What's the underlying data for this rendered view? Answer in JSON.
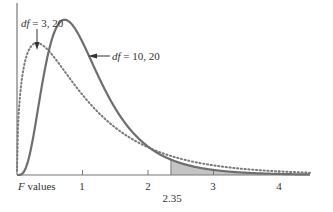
{
  "chart_data": {
    "type": "line",
    "title": "",
    "xlabel": "F values",
    "ylabel": "",
    "xlim": [
      0,
      4.45
    ],
    "x_ticks": [
      1,
      2,
      3,
      4
    ],
    "x_tick_labels": [
      "1",
      "2",
      "3",
      "4"
    ],
    "grid": false,
    "series": [
      {
        "name": "df = 3, 20",
        "df1": 3,
        "df2": 20,
        "style": "dotted",
        "color": "#7a7a7a",
        "peak_x": 0.3,
        "peak_y": 0.65
      },
      {
        "name": "df = 10, 20",
        "df1": 10,
        "df2": 20,
        "style": "solid",
        "color": "#6e6e6e",
        "peak_x": 0.73,
        "peak_y": 0.77
      }
    ],
    "shaded_region": {
      "from": 2.35,
      "to": 4.45,
      "series": "df = 10, 20",
      "color": "#c4c4c4"
    },
    "annotations": [
      {
        "text": "df = 3, 20",
        "arrow_to": [
          0.32,
          0.68
        ]
      },
      {
        "text": "df = 10, 20",
        "arrow_to": [
          1.07,
          0.64
        ]
      },
      {
        "text": "2.35",
        "position": "below axis at x=2.35"
      }
    ]
  },
  "labels": {
    "xlabel_italic": "F",
    "xlabel_rest": " values",
    "critical": "2.35",
    "df1_italic": "df",
    "df1_rest": " = 3, 20",
    "df2_italic": "df",
    "df2_rest": " = 10, 20",
    "tick1": "1",
    "tick2": "2",
    "tick3": "3",
    "tick4": "4"
  }
}
